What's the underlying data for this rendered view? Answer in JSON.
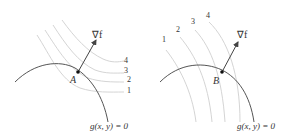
{
  "panels": [
    {
      "id": "left",
      "point_label": "A",
      "gradient_label": "∇f",
      "constraint_label": "g(x, y) = 0",
      "level_labels": [
        "1",
        "2",
        "3",
        "4"
      ]
    },
    {
      "id": "right",
      "point_label": "B",
      "gradient_label": "∇f",
      "constraint_label": "g(x, y) = 0",
      "level_labels": [
        "1",
        "2",
        "3",
        "4"
      ]
    }
  ],
  "colors": {
    "constraint_curve": "#555555",
    "level_curves": "#c8c8c8",
    "arrow": "#444444",
    "text": "#333333"
  }
}
